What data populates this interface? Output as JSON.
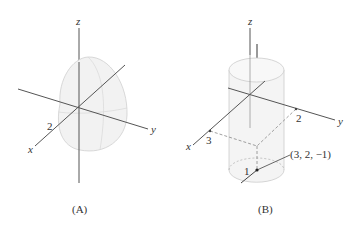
{
  "figures": [
    {
      "id": "A",
      "caption": "(A)",
      "surface": "hemisphere-like solid",
      "axes": {
        "x": "x",
        "y": "y",
        "z": "z"
      },
      "tick_labels": {
        "x": "2"
      }
    },
    {
      "id": "B",
      "caption": "(B)",
      "surface": "cylinder",
      "axes": {
        "x": "x",
        "y": "y",
        "z": "z"
      },
      "tick_labels": {
        "x": "3",
        "y": "2",
        "radius": "1"
      },
      "point_label": "(3, 2, −1)"
    }
  ],
  "colors": {
    "axis": "#555555",
    "surface_fill": "#f2f2f2",
    "surface_edge": "#c8c8c8",
    "dashed": "#888888"
  }
}
